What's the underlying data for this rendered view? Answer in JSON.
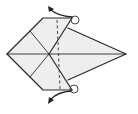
{
  "diagram": {
    "type": "origami-fold-instruction",
    "elements": {
      "model_shape": "kite-base",
      "fold_line": "valley-fold-dashed-vertical",
      "markers": [
        "circle-top-flap-point",
        "circle-bottom-flap-point"
      ],
      "arrows": [
        "pull-out-arrow-up",
        "pull-out-arrow-down"
      ]
    },
    "colors": {
      "paper": "#eeeeee",
      "line": "#2a2a2a",
      "background": "#ffffff"
    }
  }
}
